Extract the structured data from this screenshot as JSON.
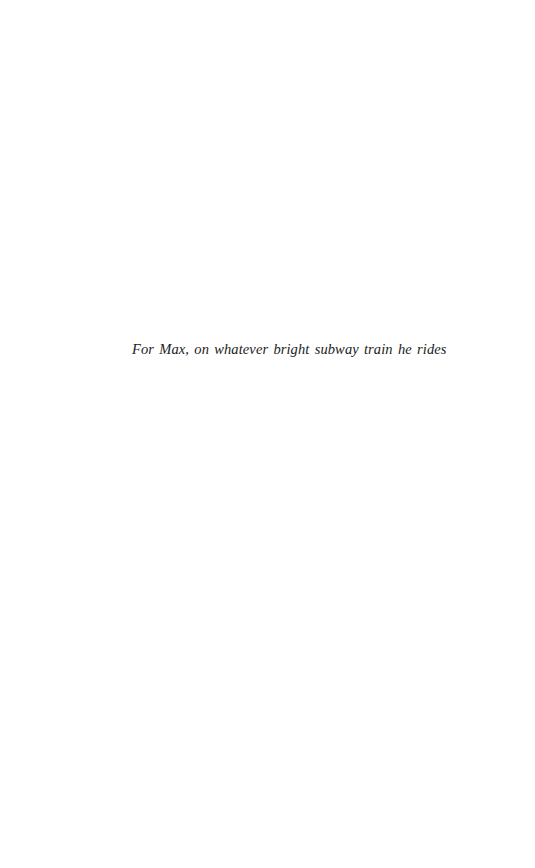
{
  "page": {
    "type": "dedication-page",
    "dedication": "For Max, on whatever bright subway train he rides"
  },
  "colors": {
    "background": "#ffffff",
    "text": "#222222"
  }
}
